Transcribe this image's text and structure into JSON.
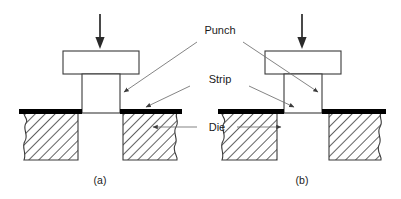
{
  "figure": {
    "labels": {
      "punch": "Punch",
      "strip": "Strip",
      "die": "Die"
    },
    "captions": {
      "a": "(a)",
      "b": "(b)"
    },
    "colors": {
      "line": "#3a3a3a",
      "leader": "#6e6e6e",
      "strip": "#000000",
      "hatch": "#2e2e2e",
      "text": "#1a1a1a",
      "background": "#ffffff"
    },
    "panels": [
      {
        "id": "a",
        "caption": "(a)",
        "clearance": "small",
        "force_arrow": "downward-force-arrow"
      },
      {
        "id": "b",
        "caption": "(b)",
        "clearance": "large",
        "force_arrow": "downward-force-arrow"
      }
    ]
  }
}
